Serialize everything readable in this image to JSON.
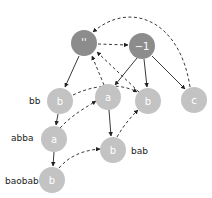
{
  "diagram": {
    "type": "trie-with-suffix-links",
    "colors": {
      "root_node": "#8c8c8c",
      "node": "#c3c3c3",
      "node_text": "#ffffff",
      "edge": "#222222",
      "label": "#222222"
    },
    "nodes": [
      {
        "id": "root",
        "text": "''",
        "kind": "root"
      },
      {
        "id": "neg1",
        "text": "−1",
        "kind": "root"
      },
      {
        "id": "b1",
        "text": "b",
        "label": "bb"
      },
      {
        "id": "a1",
        "text": "a"
      },
      {
        "id": "b2",
        "text": "b"
      },
      {
        "id": "c1",
        "text": "c"
      },
      {
        "id": "a2",
        "text": "a",
        "label": "abba"
      },
      {
        "id": "b3",
        "text": "b",
        "label": "bab"
      },
      {
        "id": "b4",
        "text": "b",
        "label": "baobab"
      }
    ],
    "edges_solid": [
      [
        "root",
        "b1"
      ],
      [
        "neg1",
        "a1"
      ],
      [
        "neg1",
        "b2"
      ],
      [
        "neg1",
        "c1"
      ],
      [
        "b1",
        "a2"
      ],
      [
        "a2",
        "b4"
      ],
      [
        "a1",
        "b3"
      ]
    ],
    "edges_dashed": [
      [
        "root",
        "neg1"
      ],
      [
        "c1",
        "root"
      ],
      [
        "b1",
        "b2"
      ],
      [
        "a1",
        "root"
      ],
      [
        "b2",
        "root"
      ],
      [
        "a2",
        "a1"
      ],
      [
        "b3",
        "b2"
      ],
      [
        "b4",
        "b3"
      ]
    ]
  }
}
